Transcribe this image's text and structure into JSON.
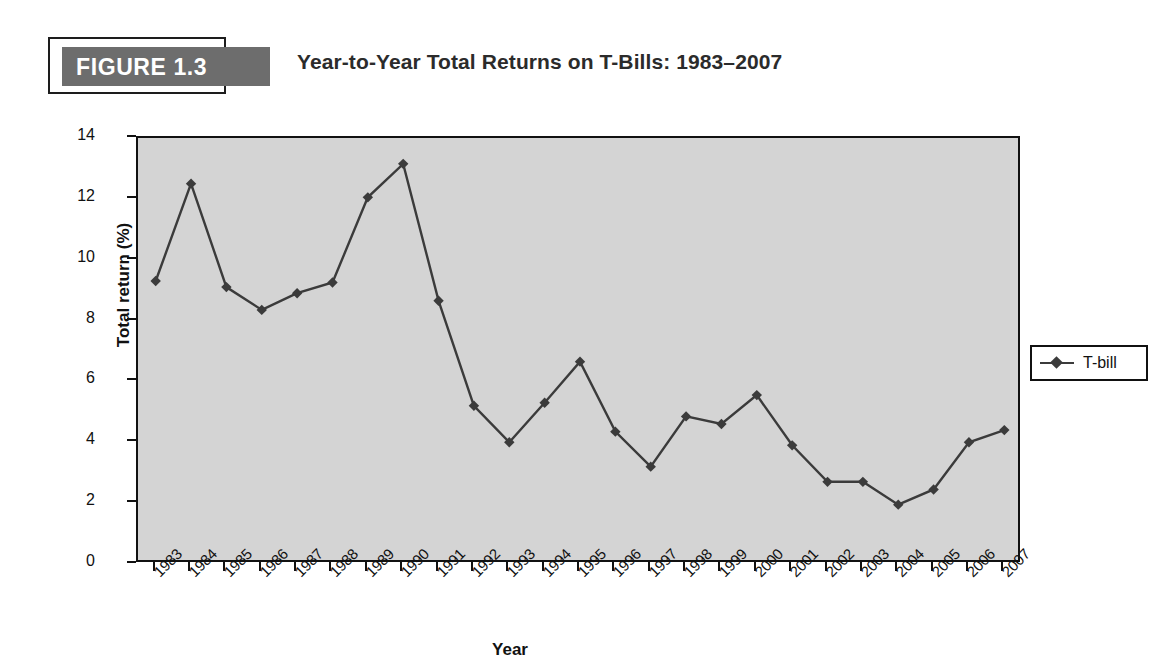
{
  "figure": {
    "badge_label": "FIGURE 1.3",
    "title": "Year-to-Year Total Returns on T-Bills: 1983–2007",
    "badge_bg": "#6d6d6d",
    "badge_text_color": "#ffffff"
  },
  "legend": {
    "position": "right",
    "entries": [
      {
        "label": "T-bill",
        "color": "#3b3b3b",
        "marker": "diamond"
      }
    ]
  },
  "colors": {
    "plot_background": "#d4d4d4",
    "axis": "#111111",
    "series": "#3b3b3b",
    "page_background": "#ffffff"
  },
  "chart_data": {
    "type": "line",
    "title": "Year-to-Year Total Returns on T-Bills: 1983–2007",
    "xlabel": "Year",
    "ylabel": "Total return (%)",
    "ylim": [
      0,
      14
    ],
    "ytick_labels": [
      "0",
      "2",
      "4",
      "6",
      "8",
      "10",
      "12",
      "14"
    ],
    "yticks": [
      0,
      2,
      4,
      6,
      8,
      10,
      12,
      14
    ],
    "grid": false,
    "legend_position": "right",
    "categories": [
      "1983",
      "1984",
      "1985",
      "1986",
      "1987",
      "1988",
      "1989",
      "1990",
      "1991",
      "1992",
      "1993",
      "1994",
      "1995",
      "1996",
      "1997",
      "1998",
      "1999",
      "2000",
      "2001",
      "2002",
      "2003",
      "2004",
      "2005",
      "2006",
      "2007"
    ],
    "x": [
      "1983",
      "1984",
      "1985",
      "1986",
      "1987",
      "1988",
      "1989",
      "1990",
      "1991",
      "1992",
      "1993",
      "1994",
      "1995",
      "1996",
      "1997",
      "1998",
      "1999",
      "2000",
      "2001",
      "2002",
      "2003",
      "2004",
      "2005",
      "2006",
      "2007"
    ],
    "series": [
      {
        "name": "T-bill",
        "marker": "diamond",
        "color": "#3b3b3b",
        "values": [
          9.3,
          12.5,
          9.1,
          8.35,
          8.9,
          9.25,
          12.05,
          13.15,
          8.65,
          5.2,
          4.0,
          5.3,
          6.65,
          4.35,
          3.2,
          4.85,
          4.6,
          5.55,
          3.9,
          2.7,
          2.7,
          1.95,
          2.45,
          4.0,
          4.4
        ]
      }
    ]
  }
}
